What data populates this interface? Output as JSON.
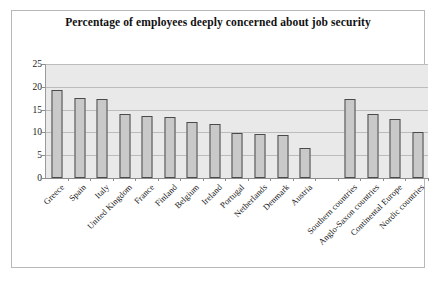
{
  "chart_data": {
    "type": "bar",
    "title": "Percentage of employees deeply concerned about job security",
    "xlabel": "",
    "ylabel": "",
    "ylim": [
      0,
      25
    ],
    "yticks": [
      0,
      5,
      10,
      15,
      20,
      25
    ],
    "grid": true,
    "legend": "none",
    "categories": [
      "Greece",
      "Spain",
      "Italy",
      "United Kingdom",
      "France",
      "Finland",
      "Belgium",
      "Ireland",
      "Portugal",
      "Netherlands",
      "Denmark",
      "Austria",
      "",
      "Southern countries",
      "Anglo-Saxon countries",
      "Continental Europe",
      "Nordic countries"
    ],
    "values": [
      19.3,
      17.6,
      17.4,
      14.0,
      13.7,
      13.3,
      12.3,
      11.9,
      9.9,
      9.6,
      9.4,
      6.5,
      null,
      17.3,
      14.1,
      12.9,
      10.1
    ],
    "colors": {
      "bar_fill": "#c9c9c9",
      "bar_border": "#4a4a4a",
      "plot_background": "#e9e9e9",
      "gridline": "#bcbcbc",
      "axis": "#8d8d8d",
      "frame": "#b8b8b8",
      "text": "#151515"
    }
  }
}
